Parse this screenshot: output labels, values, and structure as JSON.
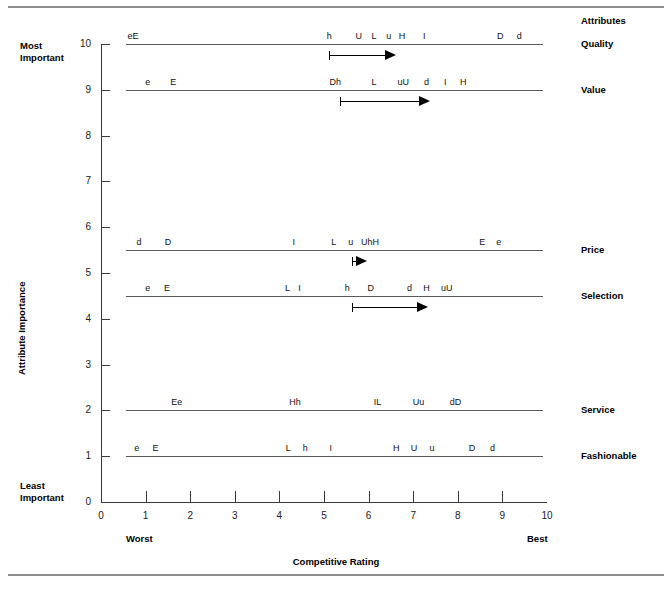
{
  "chart_data": {
    "type": "scatter",
    "title": "",
    "xlabel": "Competitive Rating",
    "ylabel": "Attribute Importance",
    "xlim": [
      0,
      10
    ],
    "ylim": [
      0,
      10
    ],
    "grid": false,
    "x_ticks": [
      "0",
      "1",
      "2",
      "3",
      "4",
      "5",
      "6",
      "7",
      "8",
      "9",
      "10"
    ],
    "y_ticks": [
      "0",
      "1",
      "2",
      "3",
      "4",
      "5",
      "6",
      "7",
      "8",
      "9",
      "10"
    ],
    "x_end_labels": {
      "low": "Worst",
      "high": "Best"
    },
    "y_end_labels": {
      "high_line1": "Most",
      "high_line2": "Important",
      "low_line1": "Least",
      "low_line2": "Important"
    },
    "right_header": "Attributes",
    "series_note": "Each attribute is a horizontal line at its importance level; letters are competitor/brand codes plotted at their competitive rating.",
    "rows": [
      {
        "label": "Quality",
        "importance": 10,
        "line_x": [
          0.55,
          9.9
        ],
        "marks": [
          {
            "text": "eE",
            "x": 0.72
          },
          {
            "text": "h",
            "x": 5.12
          },
          {
            "text": "U",
            "x": 5.78
          },
          {
            "text": "L",
            "x": 6.12
          },
          {
            "text": "u",
            "x": 6.45
          },
          {
            "text": "H",
            "x": 6.75
          },
          {
            "text": "I",
            "x": 7.25
          },
          {
            "text": "D",
            "x": 8.95
          },
          {
            "text": "d",
            "x": 9.38
          }
        ],
        "arrow": {
          "from": 5.12,
          "to": 6.6
        }
      },
      {
        "label": "Value",
        "importance": 9,
        "line_x": [
          0.55,
          9.9
        ],
        "marks": [
          {
            "text": "e",
            "x": 1.05
          },
          {
            "text": "E",
            "x": 1.62
          },
          {
            "text": "Dh",
            "x": 5.25
          },
          {
            "text": "L",
            "x": 6.12
          },
          {
            "text": "uU",
            "x": 6.78
          },
          {
            "text": "d",
            "x": 7.3
          },
          {
            "text": "I",
            "x": 7.72
          },
          {
            "text": "H",
            "x": 8.12
          }
        ],
        "arrow": {
          "from": 5.36,
          "to": 7.35
        }
      },
      {
        "label": "Price",
        "importance": 5.5,
        "line_x": [
          0.55,
          9.9
        ],
        "marks": [
          {
            "text": "d",
            "x": 0.85
          },
          {
            "text": "D",
            "x": 1.5
          },
          {
            "text": "I",
            "x": 4.32
          },
          {
            "text": "L",
            "x": 5.22
          },
          {
            "text": "u",
            "x": 5.6
          },
          {
            "text": "UhH",
            "x": 6.03
          },
          {
            "text": "E",
            "x": 8.55
          },
          {
            "text": "e",
            "x": 8.92
          }
        ],
        "arrow": {
          "from": 5.62,
          "to": 5.95
        }
      },
      {
        "label": "Selection",
        "importance": 4.5,
        "line_x": [
          0.55,
          9.9
        ],
        "marks": [
          {
            "text": "e",
            "x": 1.05
          },
          {
            "text": "E",
            "x": 1.48
          },
          {
            "text": "L",
            "x": 4.18
          },
          {
            "text": "I",
            "x": 4.45
          },
          {
            "text": "h",
            "x": 5.52
          },
          {
            "text": "D",
            "x": 6.05
          },
          {
            "text": "d",
            "x": 6.92
          },
          {
            "text": "H",
            "x": 7.3
          },
          {
            "text": "uU",
            "x": 7.75
          }
        ],
        "arrow": {
          "from": 5.62,
          "to": 7.3
        }
      },
      {
        "label": "Service",
        "importance": 2,
        "line_x": [
          0.55,
          9.9
        ],
        "marks": [
          {
            "text": "Ee",
            "x": 1.7
          },
          {
            "text": "Hh",
            "x": 4.35
          },
          {
            "text": "IL",
            "x": 6.2
          },
          {
            "text": "Uu",
            "x": 7.12
          },
          {
            "text": "dD",
            "x": 7.95
          }
        ],
        "arrow": null
      },
      {
        "label": "Fashionable",
        "importance": 1,
        "line_x": [
          0.55,
          9.9
        ],
        "marks": [
          {
            "text": "e",
            "x": 0.8
          },
          {
            "text": "E",
            "x": 1.22
          },
          {
            "text": "L",
            "x": 4.2
          },
          {
            "text": "h",
            "x": 4.58
          },
          {
            "text": "I",
            "x": 5.15
          },
          {
            "text": "H",
            "x": 6.62
          },
          {
            "text": "U",
            "x": 7.02
          },
          {
            "text": "u",
            "x": 7.42
          },
          {
            "text": "D",
            "x": 8.32
          },
          {
            "text": "d",
            "x": 8.78
          }
        ],
        "arrow": null
      }
    ]
  }
}
